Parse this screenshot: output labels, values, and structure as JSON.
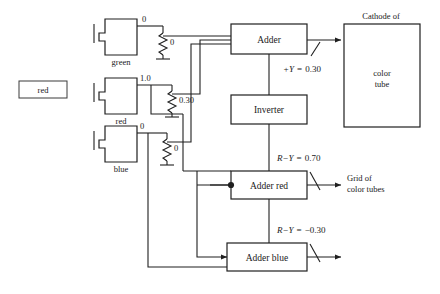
{
  "figure": {
    "type": "block-circuit-diagram"
  },
  "legend": {
    "swatch_label": "red"
  },
  "photocells": [
    {
      "name": "green",
      "label": "green",
      "output_value": "0",
      "resistor_value": "0"
    },
    {
      "name": "red",
      "label": "red",
      "output_value": "1.0",
      "resistor_value": "0.30"
    },
    {
      "name": "blue",
      "label": "blue",
      "output_value": "0",
      "resistor_value": "0"
    }
  ],
  "blocks": {
    "adder": "Adder",
    "inverter": "Inverter",
    "adder_red": "Adder red",
    "adder_blue": "Adder blue"
  },
  "output_box": {
    "caption_above": "Cathode of",
    "inner_line1": "color",
    "inner_line2": "tube"
  },
  "output_texts": {
    "grid_line1": "Grid of",
    "grid_line2": "color tubes"
  },
  "signals": [
    {
      "name": "luminance",
      "expr": "+Y",
      "equals": "=",
      "value": "0.30"
    },
    {
      "name": "red-minus-y",
      "expr": "R−Y",
      "equals": "=",
      "value": "0.70"
    },
    {
      "name": "blue-minus-y",
      "expr": "R−Y",
      "equals": "=",
      "value": "−0.30"
    }
  ],
  "colors": {
    "ink": "#1f1f1f",
    "paper": "#ffffff"
  }
}
